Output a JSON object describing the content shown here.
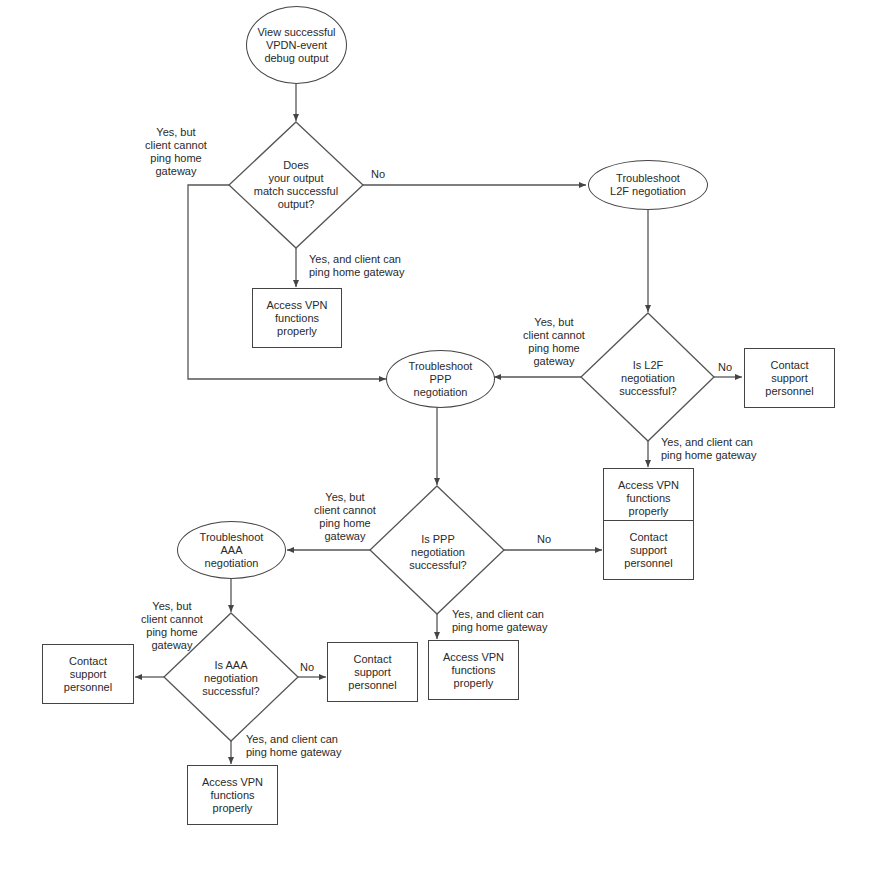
{
  "diagram": {
    "type": "flowchart",
    "nodes": {
      "start": {
        "shape": "oval",
        "text": "View successful\nVPDN-event\ndebug output"
      },
      "d1": {
        "shape": "diamond",
        "text": "Does\nyour output\nmatch successful\noutput?"
      },
      "access1": {
        "shape": "box",
        "text": "Access VPN\nfunctions\nproperly"
      },
      "l2f": {
        "shape": "oval",
        "text": "Troubleshoot\nL2F negotiation"
      },
      "d2": {
        "shape": "diamond",
        "text": "Is L2F\nnegotiation\nsuccessful?"
      },
      "contact1": {
        "shape": "box",
        "text": "Contact\nsupport\npersonnel"
      },
      "access2": {
        "shape": "box",
        "text": "Access VPN\nfunctions\nproperly"
      },
      "ppp": {
        "shape": "oval",
        "text": "Troubleshoot\nPPP\nnegotiation"
      },
      "d3": {
        "shape": "diamond",
        "text": "Is PPP\nnegotiation\nsuccessful?"
      },
      "contact2": {
        "shape": "box",
        "text": "Contact\nsupport\npersonnel"
      },
      "access3": {
        "shape": "box",
        "text": "Access VPN\nfunctions\nproperly"
      },
      "aaa": {
        "shape": "oval",
        "text": "Troubleshoot\nAAA\nnegotiation"
      },
      "d4": {
        "shape": "diamond",
        "text": "Is AAA\nnegotiation\nsuccessful?"
      },
      "contact3": {
        "shape": "box",
        "text": "Contact\nsupport\npersonnel"
      },
      "contact4": {
        "shape": "box",
        "text": "Contact\nsupport\npersonnel"
      },
      "access4": {
        "shape": "box",
        "text": "Access VPN\nfunctions\nproperly"
      }
    },
    "edge_labels": {
      "d1_left": "Yes, but\nclient cannot\nping home\ngateway",
      "d1_right": "No",
      "d1_down": "Yes, and client can\nping home gateway",
      "d2_left": "Yes, but\nclient cannot\nping home\ngateway",
      "d2_right": "No",
      "d2_down": "Yes, and client can\nping home gateway",
      "d3_left": "Yes, but\nclient cannot\nping home\ngateway",
      "d3_right": "No",
      "d3_down": "Yes, and client can\nping home gateway",
      "d4_left": "Yes, but\nclient cannot\nping home\ngateway",
      "d4_right": "No",
      "d4_down": "Yes, and client can\nping home gateway"
    }
  }
}
